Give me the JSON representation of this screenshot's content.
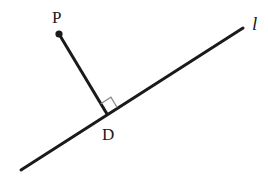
{
  "diagram": {
    "type": "geometry",
    "line": {
      "label": "l",
      "from": [
        21,
        170
      ],
      "to": [
        243,
        28
      ]
    },
    "point": {
      "label": "P",
      "x": 59,
      "y": 34
    },
    "foot": {
      "label": "D",
      "x": 107,
      "y": 114
    },
    "right_angle_marker": {
      "at": "D",
      "color": "#8c8c8c"
    },
    "colors": {
      "stroke": "#1a1a1a",
      "marker": "#8c8c8c",
      "background": "#ffffff"
    }
  },
  "labels": {
    "point_p": "P",
    "point_d": "D",
    "line_l": "l"
  }
}
